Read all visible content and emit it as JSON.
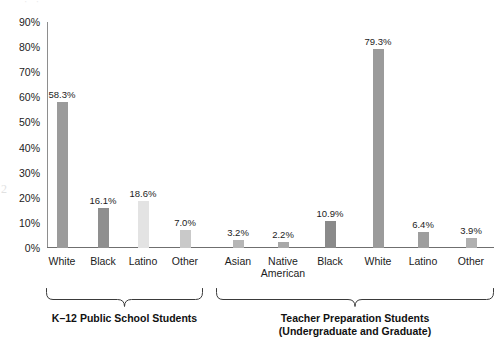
{
  "artifacts": {
    "margin_number": "2",
    "top_smudge": "· ·"
  },
  "chart_data": {
    "type": "bar",
    "title": "",
    "subtitle": "",
    "xlabel": "",
    "ylabel": "",
    "ylim": [
      0,
      90
    ],
    "grid": false,
    "legend": "none",
    "ytick_labels": [
      "90%",
      "80%",
      "70%",
      "60%",
      "50%",
      "40%",
      "30%",
      "20%",
      "10%",
      "0%"
    ],
    "ytick_values": [
      90,
      80,
      70,
      60,
      50,
      40,
      30,
      20,
      10,
      0
    ],
    "groups": [
      {
        "name": "K-12 Public School Students",
        "caption": "K–12 Public School Students",
        "categories": [
          "White",
          "Black",
          "Latino",
          "Other"
        ],
        "values": [
          58.3,
          16.1,
          18.6,
          7.0
        ],
        "value_labels": [
          "58.3%",
          "16.1%",
          "18.6%",
          "7.0%"
        ],
        "bar_colors": [
          "#9b9b9b",
          "#8f8f8f",
          "#e3e3e3",
          "#c9c9c9"
        ]
      },
      {
        "name": "Teacher Preparation Students (Undergraduate and Graduate)",
        "caption": "Teacher Preparation Students\n(Undergraduate and Graduate)",
        "categories": [
          "Asian",
          "Native American",
          "Black",
          "White",
          "Latino",
          "Other"
        ],
        "values": [
          3.2,
          2.2,
          10.9,
          79.3,
          6.4,
          3.9
        ],
        "value_labels": [
          "3.2%",
          "2.2%",
          "10.9%",
          "79.3%",
          "6.4%",
          "3.9%"
        ],
        "bar_colors": [
          "#b6b6b6",
          "#a8a8a8",
          "#8a8a8a",
          "#9b9b9b",
          "#9e9e9e",
          "#b0b0b0"
        ]
      }
    ],
    "colors": {
      "axis": "#6f6f6f",
      "text": "#1c1c1c",
      "background": "#ffffff",
      "bar_default": "#9b9b9b"
    }
  }
}
